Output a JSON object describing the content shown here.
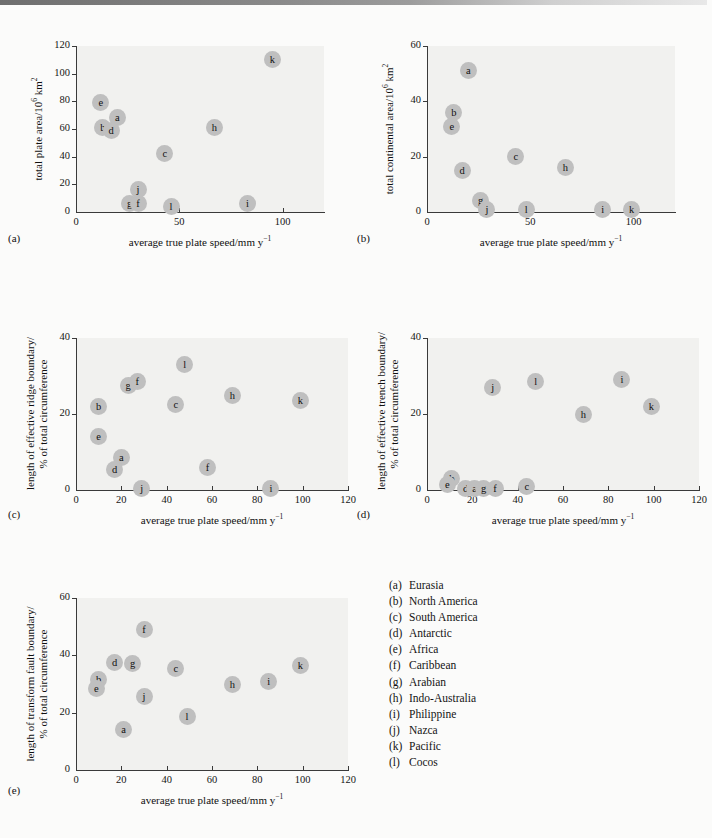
{
  "figure": {
    "xlabel": "average true plate speed/mm y",
    "xlabel_sup": "−1",
    "point_color": "#bfbfbf",
    "plot_bg": "#f1f1ef",
    "page_bg": "#fbfbfa"
  },
  "legend": {
    "items": [
      {
        "key": "(a)",
        "label": "Eurasia"
      },
      {
        "key": "(b)",
        "label": "North America"
      },
      {
        "key": "(c)",
        "label": "South America"
      },
      {
        "key": "(d)",
        "label": "Antarctic"
      },
      {
        "key": "(e)",
        "label": "Africa"
      },
      {
        "key": "(f)",
        "label": "Caribbean"
      },
      {
        "key": "(g)",
        "label": "Arabian"
      },
      {
        "key": "(h)",
        "label": "Indo-Australia"
      },
      {
        "key": "(i)",
        "label": "Philippine"
      },
      {
        "key": "(j)",
        "label": "Nazca"
      },
      {
        "key": "(k)",
        "label": "Pacific"
      },
      {
        "key": "(l)",
        "label": "Cocos"
      }
    ]
  },
  "panels": {
    "a": {
      "letter": "(a)",
      "ylabel_part1": "total plate area/10",
      "ylabel_sup": "6",
      "ylabel_part2": " km",
      "ylabel_sup2": "2",
      "xticks": [
        "0",
        "50",
        "100"
      ],
      "yticks": [
        "0",
        "20",
        "40",
        "60",
        "80",
        "100",
        "120"
      ]
    },
    "b": {
      "letter": "(b)",
      "ylabel_part1": "total continental area/10",
      "ylabel_sup": "6",
      "ylabel_part2": " km",
      "ylabel_sup2": "2",
      "xticks": [
        "0",
        "50",
        "100"
      ],
      "yticks": [
        "0",
        "20",
        "40",
        "60"
      ]
    },
    "c": {
      "letter": "(c)",
      "ylabel_line1": "length of effective ridge boundary/",
      "ylabel_line2": "% of total circumference",
      "xticks": [
        "0",
        "20",
        "40",
        "60",
        "80",
        "100",
        "120"
      ],
      "yticks": [
        "0",
        "20",
        "40"
      ]
    },
    "d": {
      "letter": "(d)",
      "ylabel_line1": "length of effective trench boundary/",
      "ylabel_line2": "% of total circumference",
      "xticks": [
        "0",
        "20",
        "40",
        "60",
        "80",
        "100",
        "120"
      ],
      "yticks": [
        "0",
        "20",
        "40"
      ]
    },
    "e": {
      "letter": "(e)",
      "ylabel_line1": "length of transform fault boundary/",
      "ylabel_line2": "% of total circumference",
      "xticks": [
        "0",
        "20",
        "40",
        "60",
        "80",
        "100",
        "120"
      ],
      "yticks": [
        "0",
        "20",
        "40",
        "60"
      ]
    }
  },
  "chart_data": [
    {
      "id": "a",
      "type": "scatter",
      "title": "",
      "xlabel": "average true plate speed/mm y^-1",
      "ylabel": "total plate area/10^6 km^2",
      "xlim": [
        0,
        120
      ],
      "ylim": [
        0,
        120
      ],
      "xticks": [
        0,
        50,
        100
      ],
      "yticks": [
        0,
        20,
        40,
        60,
        80,
        100,
        120
      ],
      "grid": false,
      "legend": "none",
      "points": [
        {
          "label": "e",
          "x": 12,
          "y": 79
        },
        {
          "label": "a",
          "x": 20,
          "y": 68
        },
        {
          "label": "b",
          "x": 13,
          "y": 61
        },
        {
          "label": "d",
          "x": 17,
          "y": 59
        },
        {
          "label": "c",
          "x": 43,
          "y": 42
        },
        {
          "label": "j",
          "x": 30,
          "y": 16
        },
        {
          "label": "g",
          "x": 26,
          "y": 6
        },
        {
          "label": "f",
          "x": 30,
          "y": 6
        },
        {
          "label": "l",
          "x": 46,
          "y": 4
        },
        {
          "label": "i",
          "x": 83,
          "y": 6
        },
        {
          "label": "h",
          "x": 67,
          "y": 61
        },
        {
          "label": "k",
          "x": 95,
          "y": 110
        }
      ]
    },
    {
      "id": "b",
      "type": "scatter",
      "title": "",
      "xlabel": "average true plate speed/mm y^-1",
      "ylabel": "total continental area/10^6 km^2",
      "xlim": [
        0,
        120
      ],
      "ylim": [
        0,
        60
      ],
      "xticks": [
        0,
        50,
        100
      ],
      "yticks": [
        0,
        20,
        40,
        60
      ],
      "grid": false,
      "legend": "none",
      "points": [
        {
          "label": "a",
          "x": 20,
          "y": 51
        },
        {
          "label": "b",
          "x": 13,
          "y": 36
        },
        {
          "label": "e",
          "x": 12,
          "y": 31
        },
        {
          "label": "d",
          "x": 17,
          "y": 15
        },
        {
          "label": "c",
          "x": 43,
          "y": 20
        },
        {
          "label": "h",
          "x": 67,
          "y": 16
        },
        {
          "label": "g",
          "x": 26,
          "y": 4
        },
        {
          "label": "j",
          "x": 29,
          "y": 1
        },
        {
          "label": "l",
          "x": 48,
          "y": 1
        },
        {
          "label": "i",
          "x": 85,
          "y": 1
        },
        {
          "label": "k",
          "x": 99,
          "y": 1
        }
      ]
    },
    {
      "id": "c",
      "type": "scatter",
      "title": "",
      "xlabel": "average true plate speed/mm y^-1",
      "ylabel": "length of effective ridge boundary/% of total circumference",
      "xlim": [
        0,
        120
      ],
      "ylim": [
        0,
        40
      ],
      "xticks": [
        0,
        20,
        40,
        60,
        80,
        100,
        120
      ],
      "yticks": [
        0,
        20,
        40
      ],
      "grid": false,
      "legend": "none",
      "points": [
        {
          "label": "l",
          "x": 48,
          "y": 33
        },
        {
          "label": "g",
          "x": 23,
          "y": 27.5
        },
        {
          "label": "f",
          "x": 27,
          "y": 28.5
        },
        {
          "label": "h",
          "x": 69,
          "y": 25
        },
        {
          "label": "k",
          "x": 99,
          "y": 23.5
        },
        {
          "label": "c",
          "x": 44,
          "y": 22.5
        },
        {
          "label": "b",
          "x": 10,
          "y": 22
        },
        {
          "label": "e",
          "x": 10,
          "y": 14
        },
        {
          "label": "a",
          "x": 20,
          "y": 8.5
        },
        {
          "label": "d",
          "x": 17,
          "y": 5.5
        },
        {
          "label": "f2",
          "x": 58,
          "y": 6
        },
        {
          "label": "j",
          "x": 29,
          "y": 0.5
        },
        {
          "label": "i",
          "x": 86,
          "y": 0.5
        }
      ]
    },
    {
      "id": "d",
      "type": "scatter",
      "title": "",
      "xlabel": "average true plate speed/mm y^-1",
      "ylabel": "length of effective trench boundary/% of total circumference",
      "xlim": [
        0,
        120
      ],
      "ylim": [
        0,
        40
      ],
      "xticks": [
        0,
        20,
        40,
        60,
        80,
        100,
        120
      ],
      "yticks": [
        0,
        20,
        40
      ],
      "grid": false,
      "legend": "none",
      "points": [
        {
          "label": "i",
          "x": 86,
          "y": 29
        },
        {
          "label": "l",
          "x": 48,
          "y": 28.5
        },
        {
          "label": "j",
          "x": 29,
          "y": 27
        },
        {
          "label": "k",
          "x": 99,
          "y": 22
        },
        {
          "label": "h",
          "x": 69,
          "y": 20
        },
        {
          "label": "b",
          "x": 11,
          "y": 3
        },
        {
          "label": "e",
          "x": 9,
          "y": 1.5
        },
        {
          "label": "d",
          "x": 17,
          "y": 0.5
        },
        {
          "label": "a",
          "x": 21,
          "y": 0.5
        },
        {
          "label": "g",
          "x": 25,
          "y": 0.5
        },
        {
          "label": "f",
          "x": 30,
          "y": 0.5
        },
        {
          "label": "c",
          "x": 44,
          "y": 1
        }
      ]
    },
    {
      "id": "e",
      "type": "scatter",
      "title": "",
      "xlabel": "average true plate speed/mm y^-1",
      "ylabel": "length of transform fault boundary/% of total circumference",
      "xlim": [
        0,
        120
      ],
      "ylim": [
        0,
        60
      ],
      "xticks": [
        0,
        20,
        40,
        60,
        80,
        100,
        120
      ],
      "yticks": [
        0,
        20,
        40,
        60
      ],
      "grid": false,
      "legend": "none",
      "points": [
        {
          "label": "f",
          "x": 30,
          "y": 49
        },
        {
          "label": "d",
          "x": 17,
          "y": 37.5
        },
        {
          "label": "g",
          "x": 25,
          "y": 37
        },
        {
          "label": "k",
          "x": 99,
          "y": 36.5
        },
        {
          "label": "c",
          "x": 44,
          "y": 35.5
        },
        {
          "label": "b",
          "x": 10,
          "y": 31.5
        },
        {
          "label": "i",
          "x": 85,
          "y": 31
        },
        {
          "label": "h",
          "x": 69,
          "y": 30
        },
        {
          "label": "e",
          "x": 9,
          "y": 28.5
        },
        {
          "label": "j",
          "x": 30,
          "y": 25.5
        },
        {
          "label": "l",
          "x": 49,
          "y": 18.5
        },
        {
          "label": "a",
          "x": 21,
          "y": 14
        }
      ]
    }
  ]
}
